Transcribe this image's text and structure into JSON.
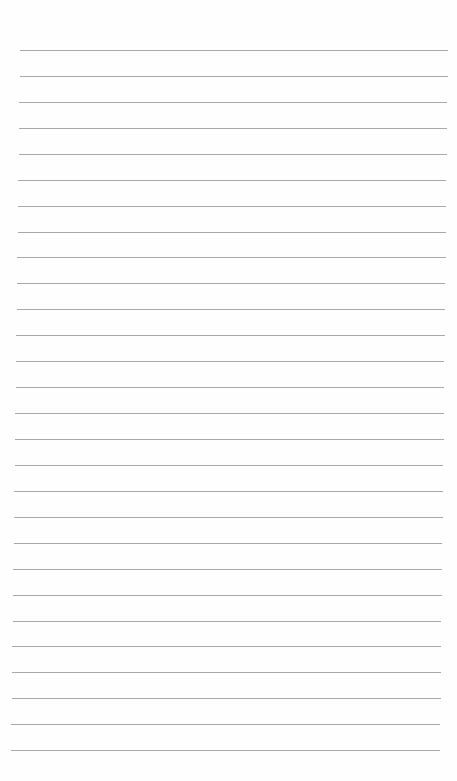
{
  "page": {
    "type": "blank lined paper",
    "line_count": 28,
    "line_color": "#9a9a9a",
    "background_color": "#fefefe"
  }
}
